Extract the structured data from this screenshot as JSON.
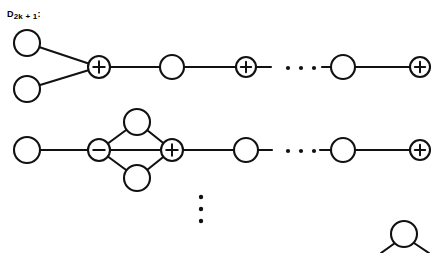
{
  "figure": {
    "label": {
      "base": "D",
      "subscript": "2k + 1",
      "colon": ":",
      "full_text": "D2k + 1:"
    },
    "node_signs": {
      "plus": "+",
      "minus": "−",
      "none": ""
    },
    "ellipsis": {
      "horizontal": "· · ·",
      "vertical": "⋮"
    },
    "colors": {
      "stroke": "#111111",
      "node_fill": "#ffffff",
      "background": "#ffffff"
    },
    "rows": [
      {
        "name": "row-1-fork-chain",
        "nodes": [
          {
            "id": "r1-n1",
            "sign": "",
            "cx": 27,
            "cy": 43,
            "r": 13
          },
          {
            "id": "r1-n2",
            "sign": "",
            "cx": 27,
            "cy": 89,
            "r": 13
          },
          {
            "id": "r1-n3",
            "sign": "+",
            "cx": 99,
            "cy": 67,
            "r": 11
          },
          {
            "id": "r1-n4",
            "sign": "",
            "cx": 172,
            "cy": 67,
            "r": 12
          },
          {
            "id": "r1-n5",
            "sign": "+",
            "cx": 246,
            "cy": 67,
            "r": 10
          },
          {
            "id": "r1-n6",
            "sign": "",
            "cx": 343,
            "cy": 67,
            "r": 12
          },
          {
            "id": "r1-n7",
            "sign": "+",
            "cx": 420,
            "cy": 67,
            "r": 10
          }
        ],
        "edges": [
          {
            "from": "r1-n1",
            "to": "r1-n3"
          },
          {
            "from": "r1-n2",
            "to": "r1-n3"
          },
          {
            "from": "r1-n3",
            "to": "r1-n4"
          },
          {
            "from": "r1-n4",
            "to": "r1-n5"
          },
          {
            "from": "r1-n6",
            "to": "r1-n7"
          }
        ],
        "stubs": [
          {
            "x1": 257,
            "y1": 67,
            "x2": 271,
            "y2": 67
          },
          {
            "x1": 322,
            "y1": 67,
            "x2": 331,
            "y2": 67
          }
        ],
        "dots": [
          {
            "cx": 288,
            "cy": 68,
            "r": 2.1
          },
          {
            "cx": 301,
            "cy": 68,
            "r": 2.1
          },
          {
            "cx": 314,
            "cy": 68,
            "r": 2.1
          }
        ]
      },
      {
        "name": "row-2-diamond-chain",
        "nodes": [
          {
            "id": "r2-n1",
            "sign": "",
            "cx": 27,
            "cy": 150,
            "r": 13
          },
          {
            "id": "r2-n2",
            "sign": "−",
            "cx": 99,
            "cy": 150,
            "r": 11
          },
          {
            "id": "r2-top",
            "sign": "",
            "cx": 137,
            "cy": 122,
            "r": 13
          },
          {
            "id": "r2-bot",
            "sign": "",
            "cx": 137,
            "cy": 178,
            "r": 13
          },
          {
            "id": "r2-n3",
            "sign": "+",
            "cx": 172,
            "cy": 150,
            "r": 11
          },
          {
            "id": "r2-n4",
            "sign": "",
            "cx": 246,
            "cy": 150,
            "r": 12
          },
          {
            "id": "r2-n5",
            "sign": "",
            "cx": 343,
            "cy": 150,
            "r": 12
          },
          {
            "id": "r2-n6",
            "sign": "+",
            "cx": 420,
            "cy": 150,
            "r": 10
          }
        ],
        "edges": [
          {
            "from": "r2-n1",
            "to": "r2-n2"
          },
          {
            "from": "r2-n2",
            "to": "r2-top"
          },
          {
            "from": "r2-top",
            "to": "r2-n3"
          },
          {
            "from": "r2-n2",
            "to": "r2-bot"
          },
          {
            "from": "r2-bot",
            "to": "r2-n3"
          },
          {
            "from": "r2-n2",
            "to": "r2-n3"
          },
          {
            "from": "r2-n3",
            "to": "r2-n4"
          },
          {
            "from": "r2-n5",
            "to": "r2-n6"
          }
        ],
        "stubs": [
          {
            "x1": 258,
            "y1": 150,
            "x2": 272,
            "y2": 150
          },
          {
            "x1": 320,
            "y1": 150,
            "x2": 331,
            "y2": 150
          }
        ],
        "dots": [
          {
            "cx": 288,
            "cy": 151,
            "r": 2.1
          },
          {
            "cx": 301,
            "cy": 151,
            "r": 2.1
          },
          {
            "cx": 314,
            "cy": 151,
            "r": 2.1
          }
        ]
      },
      {
        "name": "row-3-partial-bottom",
        "nodes": [
          {
            "id": "r3-n1",
            "sign": "",
            "cx": 404,
            "cy": 234,
            "r": 13
          }
        ],
        "edges": [],
        "stubs": [
          {
            "x1": 395,
            "y1": 243,
            "x2": 381,
            "y2": 253
          },
          {
            "x1": 414,
            "y1": 243,
            "x2": 429,
            "y2": 253
          }
        ],
        "dots": []
      }
    ],
    "vertical_dots": [
      {
        "cx": 201,
        "cy": 197,
        "r": 2.2
      },
      {
        "cx": 201,
        "cy": 209,
        "r": 2.2
      },
      {
        "cx": 201,
        "cy": 221,
        "r": 2.2
      }
    ]
  }
}
